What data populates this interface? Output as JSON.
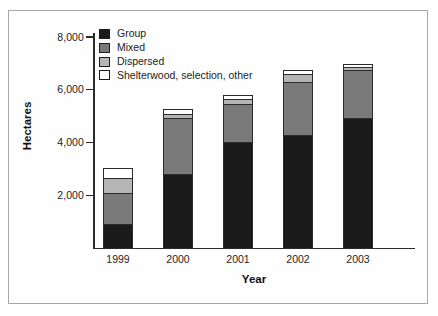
{
  "chart_data": {
    "type": "bar",
    "subtype": "stacked-bar",
    "title": "",
    "xlabel": "Year",
    "ylabel": "Hectares",
    "categories": [
      "1999",
      "2000",
      "2001",
      "2002",
      "2003"
    ],
    "ylim": [
      0,
      8000
    ],
    "yticks": [
      2000,
      4000,
      6000,
      8000
    ],
    "ytick_labels": [
      "2,000",
      "4,000",
      "6,000",
      "8,000"
    ],
    "grid": false,
    "legend_position": "top-left inside plot",
    "series": [
      {
        "name": "Group",
        "color": "#1a1a1a",
        "values": [
          910,
          2800,
          4015,
          4280,
          4925
        ]
      },
      {
        "name": "Mixed",
        "color": "#7a7a7a",
        "values": [
          1175,
          2120,
          1440,
          2010,
          1820
        ]
      },
      {
        "name": "Dispersed",
        "color": "#b5b5b5",
        "values": [
          570,
          150,
          190,
          300,
          110
        ]
      },
      {
        "name": "Shelterwood, selection, other",
        "color": "#ffffff",
        "values": [
          380,
          190,
          150,
          150,
          110
        ]
      }
    ],
    "totals": [
      3035,
      5260,
      5795,
      6740,
      6965
    ]
  },
  "legend": {
    "items": [
      {
        "label": "Group",
        "color": "#1a1a1a"
      },
      {
        "label": "Mixed",
        "color": "#7a7a7a"
      },
      {
        "label": "Dispersed",
        "color": "#b5b5b5"
      },
      {
        "label": "Shelterwood, selection, other",
        "color": "#ffffff"
      }
    ]
  },
  "axes": {
    "y_title": "Hectares",
    "x_title": "Year",
    "y_ticks": [
      "8,000",
      "6,000",
      "4,000",
      "2,000"
    ],
    "x_ticks": [
      "1999",
      "2000",
      "2001",
      "2002",
      "2003"
    ]
  }
}
